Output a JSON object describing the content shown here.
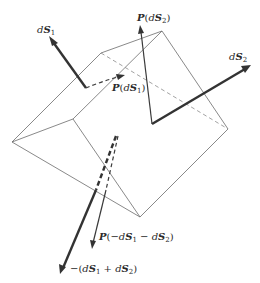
{
  "figure": {
    "type": "vector-diagram"
  },
  "labels": {
    "dS1": {
      "d": "d",
      "S": "S",
      "sub": "1"
    },
    "dS2": {
      "d": "d",
      "S": "S",
      "sub": "2"
    },
    "P_dS1": {
      "P": "P",
      "open": "(",
      "d": "d",
      "S": "S",
      "sub": "1",
      "close": ")"
    },
    "P_dS2": {
      "P": "P",
      "open": "(",
      "d": "d",
      "S": "S",
      "sub": "2",
      "close": ")"
    },
    "P_neg_sum": {
      "P": "P",
      "open": "(−",
      "d1": "d",
      "S1": "S",
      "sub1": "1",
      "minus": " − ",
      "d2": "d",
      "S2": "S",
      "sub2": "2",
      "close": ")"
    },
    "neg_sum": {
      "prefix": "−(",
      "d1": "d",
      "S1": "S",
      "sub1": "1",
      "plus": " + ",
      "d2": "d",
      "S2": "S",
      "sub2": "2",
      "close": ")"
    }
  },
  "colors": {
    "edge": "#6b6b6b",
    "vector": "#333333",
    "background": "#ffffff"
  }
}
